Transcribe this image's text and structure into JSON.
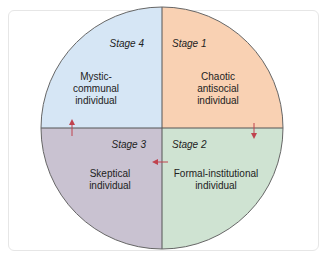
{
  "diagram": {
    "type": "quadrant-circle",
    "colors": {
      "q1": "#f9d1b3",
      "q2": "#cfe3d2",
      "q3": "#c9c2d1",
      "q4": "#d6e6f5",
      "divider": "#555555",
      "arrow": "#c0424e",
      "border": "#666666"
    },
    "quadrants": [
      {
        "stage": "Stage 1",
        "label_lines": [
          "Chaotic",
          "antisocial",
          "individual"
        ]
      },
      {
        "stage": "Stage 2",
        "label_lines": [
          "Formal-institutional",
          "individual"
        ]
      },
      {
        "stage": "Stage 3",
        "label_lines": [
          "Skeptical",
          "individual"
        ]
      },
      {
        "stage": "Stage 4",
        "label_lines": [
          "Mystic-",
          "communal",
          "individual"
        ]
      }
    ],
    "arrows": [
      "stage1-to-stage2 (down)",
      "stage2-to-stage3 (left)",
      "stage3-to-stage4 (up)"
    ]
  }
}
